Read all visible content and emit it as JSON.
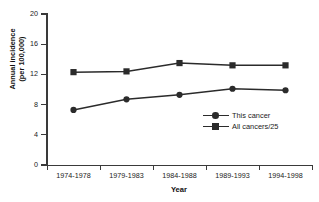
{
  "chart_data": {
    "type": "line",
    "title": "",
    "xlabel": "Year",
    "ylabel_line1": "Annual incidence",
    "ylabel_line2": "(per 100,000)",
    "categories": [
      "1974-1978",
      "1979-1983",
      "1984-1988",
      "1989-1993",
      "1994-1998"
    ],
    "series": [
      {
        "name": "This cancer",
        "marker": "circle",
        "color": "#2b2b2b",
        "values": [
          7.3,
          8.7,
          9.3,
          10.1,
          9.9
        ]
      },
      {
        "name": "All cancers/25",
        "marker": "square",
        "color": "#2b2b2b",
        "values": [
          12.3,
          12.4,
          13.5,
          13.2,
          13.2
        ]
      }
    ],
    "ylim": [
      0,
      20
    ],
    "yticks": [
      0,
      4,
      8,
      12,
      16,
      20
    ],
    "ytick_labels": [
      "0",
      "4",
      "8",
      "12",
      "16",
      "20"
    ],
    "grid": false,
    "legend_position": "inside-right-middle"
  },
  "legend": {
    "items": [
      {
        "label": "This cancer",
        "marker": "circle"
      },
      {
        "label": "All cancers/25",
        "marker": "square"
      }
    ]
  }
}
